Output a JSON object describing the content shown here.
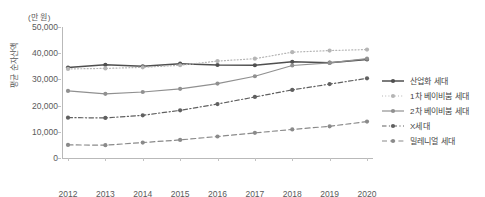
{
  "chart_data": {
    "type": "line",
    "title": "",
    "unit_label": "(만 원)",
    "ylabel": "평균 순자산액",
    "xlabel": "",
    "categories": [
      "2012",
      "2013",
      "2014",
      "2015",
      "2016",
      "2017",
      "2018",
      "2019",
      "2020"
    ],
    "ylim": [
      0,
      50000
    ],
    "ytick_values": [
      0,
      10000,
      20000,
      30000,
      40000,
      50000
    ],
    "ytick_labels": [
      "0",
      "10,000",
      "20,000",
      "30,000",
      "40,000",
      "50,000"
    ],
    "grid": false,
    "legend_position": "right",
    "series": [
      {
        "name": "산업화 세대",
        "color": "#4f4f4f",
        "style": "solid",
        "values": [
          34500,
          35600,
          35000,
          36000,
          35500,
          35400,
          36700,
          36400,
          37600
        ]
      },
      {
        "name": "1차 베이비붐 세대",
        "color": "#b5b5b5",
        "style": "dotted",
        "values": [
          34000,
          34200,
          34600,
          35400,
          37000,
          37900,
          40400,
          41000,
          41400
        ]
      },
      {
        "name": "2차 베이비붐 세대",
        "color": "#909090",
        "style": "solid",
        "values": [
          25600,
          24500,
          25200,
          26400,
          28400,
          31200,
          35300,
          36300,
          37900
        ]
      },
      {
        "name": "X세대",
        "color": "#606060",
        "style": "dashdot",
        "values": [
          15400,
          15300,
          16300,
          18200,
          20600,
          23300,
          26000,
          28200,
          30400
        ]
      },
      {
        "name": "밀레니얼 세대",
        "color": "#8a8a8a",
        "style": "dashed",
        "values": [
          5000,
          4900,
          5900,
          6900,
          8200,
          9600,
          10900,
          12100,
          13900
        ]
      }
    ]
  }
}
